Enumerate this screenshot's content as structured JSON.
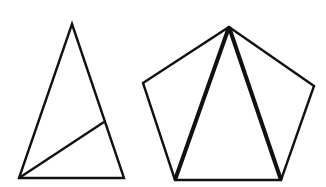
{
  "figure": {
    "background": "#ffffff",
    "stroke_color": "#111111",
    "triangle": {
      "vertices": {
        "apex": [
          72,
          24
        ],
        "bottom_left": [
          19,
          178
        ],
        "bottom_right": [
          124,
          178
        ]
      },
      "cevian": {
        "from": [
          19,
          178
        ],
        "to": [
          104,
          122
        ]
      },
      "stroke_width": 2.4
    },
    "pentagon": {
      "vertices": {
        "top": [
          229,
          27
        ],
        "right": [
          314,
          86
        ],
        "bottom_right": [
          281,
          180
        ],
        "bottom_left": [
          175,
          180
        ],
        "left": [
          143,
          83
        ]
      },
      "stroke_width": 2.4,
      "diagonals": [
        {
          "from": [
            229,
            27
          ],
          "to": [
            175,
            180
          ]
        },
        {
          "from": [
            229,
            27
          ],
          "to": [
            281,
            180
          ]
        }
      ],
      "diagonal_stroke_width": 4
    }
  }
}
